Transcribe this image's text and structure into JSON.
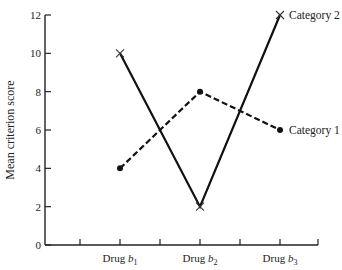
{
  "chart_data": {
    "type": "line",
    "title": "",
    "xlabel": "",
    "ylabel": "Mean criterion score",
    "categories": [
      "Drug b1",
      "Drug b2",
      "Drug b3"
    ],
    "category_labels": [
      {
        "main": "Drug ",
        "italic": "b",
        "sub": "1"
      },
      {
        "main": "Drug ",
        "italic": "b",
        "sub": "2"
      },
      {
        "main": "Drug ",
        "italic": "b",
        "sub": "3"
      }
    ],
    "ylim": [
      0,
      12
    ],
    "yticks": [
      0,
      2,
      4,
      6,
      8,
      10,
      12
    ],
    "grid": false,
    "legend_position": "inline-right",
    "series": [
      {
        "name": "Category 1",
        "values": [
          4,
          8,
          6
        ],
        "line_style": "dashed",
        "marker": "dot"
      },
      {
        "name": "Category 2",
        "values": [
          10,
          2,
          12
        ],
        "line_style": "solid",
        "marker": "x"
      }
    ]
  },
  "colors": {
    "line": "#111111",
    "axis": "#222222",
    "text": "#222222",
    "background": "#ffffff"
  }
}
